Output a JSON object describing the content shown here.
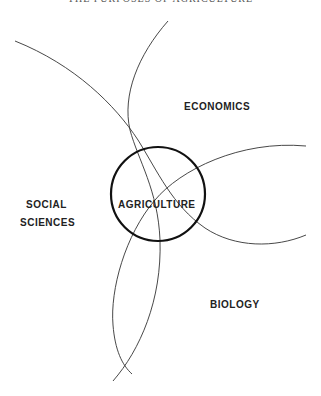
{
  "header": {
    "title": "THE PURPOSES OF AGRICULTURE"
  },
  "diagram": {
    "center_label": "AGRICULTURE",
    "labels": {
      "economics": "ECONOMICS",
      "social_line1": "SOCIAL",
      "social_line2": "SCIENCES",
      "biology": "BIOLOGY"
    },
    "colors": {
      "line": "#333333",
      "circle": "#111111",
      "text": "#222222"
    }
  }
}
